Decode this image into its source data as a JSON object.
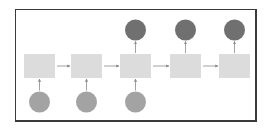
{
  "diagram": {
    "type": "rnn-unrolled-sequence",
    "colors": {
      "frame": "#3a3a3a",
      "cell": "#dcdcdc",
      "input": "#a3a3a3",
      "output": "#707070",
      "arrow": "#8a8a8a"
    },
    "cells": [
      {
        "id": "cell-1",
        "x": 24,
        "y": 54,
        "w": 31,
        "h": 24,
        "input": true,
        "output": false
      },
      {
        "id": "cell-2",
        "x": 71,
        "y": 54,
        "w": 31,
        "h": 24,
        "input": true,
        "output": false
      },
      {
        "id": "cell-3",
        "x": 120,
        "y": 54,
        "w": 31,
        "h": 24,
        "input": true,
        "output": true
      },
      {
        "id": "cell-4",
        "x": 170,
        "y": 54,
        "w": 31,
        "h": 24,
        "input": false,
        "output": true
      },
      {
        "id": "cell-5",
        "x": 219,
        "y": 54,
        "w": 31,
        "h": 24,
        "input": false,
        "output": true
      }
    ],
    "input_circle": {
      "cy": 102,
      "r": 10.5
    },
    "output_circle": {
      "cy": 30,
      "r": 10.5
    }
  }
}
